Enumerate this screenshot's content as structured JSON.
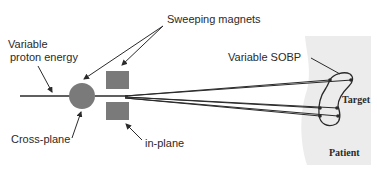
{
  "diagram": {
    "labels": {
      "sweeping_magnets": "Sweeping magnets",
      "variable_energy_line1": "Variable",
      "variable_energy_line2": "proton energy",
      "cross_plane": "Cross-plane",
      "in_plane": "in-plane",
      "variable_sobp": "Variable SOBP",
      "target": "Target",
      "patient": "Patient"
    },
    "colors": {
      "magnet_fill": "#7a7a7a",
      "patient_fill": "#ececec",
      "line": "#2a2a2a",
      "background": "#ffffff"
    }
  }
}
